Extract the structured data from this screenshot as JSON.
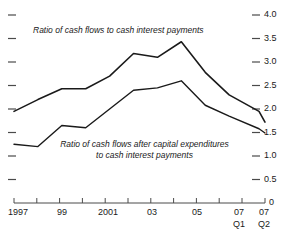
{
  "chart_data": {
    "type": "line",
    "title": "",
    "subtitle": "",
    "xlabel": "",
    "ylabel": "",
    "ylim": [
      0,
      4.0
    ],
    "y_ticks_labeled": [
      "0",
      "0.5",
      "1.0",
      "1.5",
      "2.0",
      "2.5",
      "3.0",
      "3.5",
      "4.0"
    ],
    "y_tick_values": [
      0,
      0.5,
      1.0,
      1.5,
      2.0,
      2.5,
      3.0,
      3.5,
      4.0
    ],
    "y_axis_side": "right",
    "left_tick_values": [
      0.5,
      1.0,
      1.5,
      2.0,
      2.5,
      3.0,
      3.5,
      4.0
    ],
    "grid": false,
    "legend_position": "inline-annotation",
    "x": [
      1997,
      1998,
      1999,
      2000,
      2001,
      2002,
      2003,
      2004,
      2005,
      2006,
      2007.25,
      2007.5
    ],
    "x_tick_labels": [
      "1997",
      "",
      "99",
      "",
      "2001",
      "",
      "03",
      "",
      "05",
      "",
      "07",
      "07"
    ],
    "x_tick_sublabels": [
      "",
      "",
      "",
      "",
      "",
      "",
      "",
      "",
      "",
      "",
      "Q1",
      "Q2"
    ],
    "series": [
      {
        "name": "Ratio of cash flows to cash interest payments",
        "values": [
          1.95,
          2.2,
          2.43,
          2.43,
          2.7,
          3.18,
          3.1,
          3.43,
          2.78,
          2.3,
          1.95,
          1.72
        ],
        "color": "#1a1a1a"
      },
      {
        "name": "Ratio of cash flows after capital expenditures to cash interest payments",
        "values": [
          1.25,
          1.2,
          1.65,
          1.6,
          2.0,
          2.4,
          2.45,
          2.6,
          2.08,
          1.85,
          1.58,
          1.49
        ],
        "color": "#1a1a1a"
      }
    ],
    "annotations": [
      {
        "id": "upper-series-annotation",
        "text": "Ratio of cash flows to cash interest payments",
        "lines": [
          "Ratio of cash flows to cash interest payments"
        ]
      },
      {
        "id": "lower-series-annotation",
        "text": "Ratio of cash flows after capital expenditures to cash interest payments",
        "lines": [
          "Ratio of cash flows after capital expenditures",
          "to cash interest payments"
        ]
      }
    ]
  },
  "axis": {
    "y_right": {
      "t40": "4.0",
      "t35": "3.5",
      "t30": "3.0",
      "t25": "2.5",
      "t20": "2.0",
      "t15": "1.5",
      "t10": "1.0",
      "t05": "0.5",
      "t00": "0"
    },
    "x_bottom": {
      "l1997": "1997",
      "l99": "99",
      "l2001": "2001",
      "l03": "03",
      "l05": "05",
      "l07a": "07",
      "l07a_sub": "Q1",
      "l07b": "07",
      "l07b_sub": "Q2"
    }
  },
  "annotations": {
    "upper": "Ratio of cash flows to cash interest payments",
    "lower_line1": "Ratio of cash flows after capital expenditures",
    "lower_line2": "to cash interest payments"
  },
  "colors": {
    "line": "#1a1a1a",
    "axis": "#4a4a4a",
    "background": "#ffffff"
  }
}
